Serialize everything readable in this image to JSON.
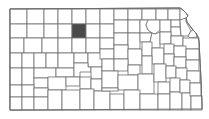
{
  "map": {
    "state": "Kansas",
    "type": "county-locator",
    "highlighted_county": "Rooks",
    "colors": {
      "background": "#ffffff",
      "county_fill": "#ffffff",
      "county_border": "#6e6e6e",
      "highlight_fill": "#4a4a4a"
    }
  }
}
